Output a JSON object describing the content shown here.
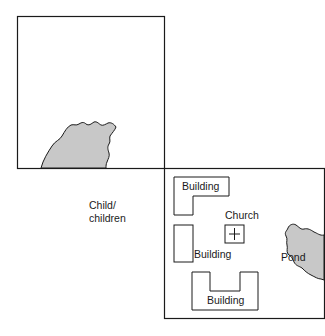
{
  "diagram": {
    "colors": {
      "stroke": "#1a1a1a",
      "water": "#c8c8c8",
      "background": "#ffffff"
    },
    "labels": {
      "child_line1": "Child/",
      "child_line2": "children",
      "building_top": "Building",
      "building_middle": "Building",
      "building_bottom": "Building",
      "church": "Church",
      "pond": "Pond"
    }
  }
}
